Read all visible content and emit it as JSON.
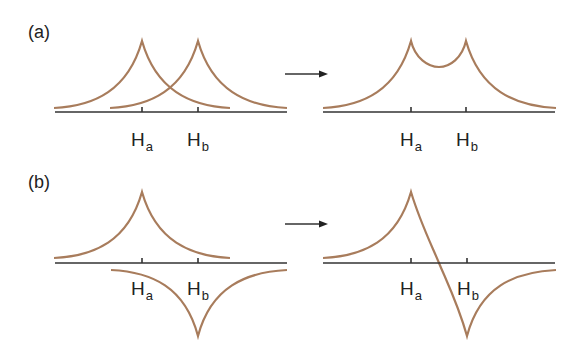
{
  "panels": [
    {
      "label": "(a)",
      "description": "Two symmetric cusp-shaped peaks at Ha and Hb superpose into a single double-cusp curve"
    },
    {
      "label": "(b)",
      "description": "Positive cusp at Ha and negative cusp at Hb superpose into an antisymmetric curve"
    }
  ],
  "axis_labels": {
    "a_left": {
      "ha": "H",
      "ha_sub": "a",
      "hb": "H",
      "hb_sub": "b"
    },
    "a_right": {
      "ha": "H",
      "ha_sub": "a",
      "hb": "H",
      "hb_sub": "b"
    },
    "b_left": {
      "ha": "H",
      "ha_sub": "a",
      "hb": "H",
      "hb_sub": "b"
    },
    "b_right": {
      "ha": "H",
      "ha_sub": "a",
      "hb": "H",
      "hb_sub": "b"
    }
  },
  "colors": {
    "curve": "#a87c5c",
    "axis": "#333333",
    "text": "#222222"
  },
  "arrow": "right-arrow"
}
